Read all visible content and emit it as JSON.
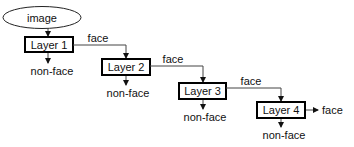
{
  "diagram": {
    "input": {
      "label": "image",
      "shape": "ellipse"
    },
    "layers": [
      {
        "label": "Layer 1",
        "reject_label": "non-face",
        "pass_label": "face"
      },
      {
        "label": "Layer 2",
        "reject_label": "non-face",
        "pass_label": "face"
      },
      {
        "label": "Layer 3",
        "reject_label": "non-face",
        "pass_label": "face"
      },
      {
        "label": "Layer 4",
        "reject_label": "non-face",
        "pass_label": "face"
      }
    ],
    "colors": {
      "box_border": "#000000",
      "line": "#444444",
      "text": "#111111",
      "background": "#ffffff"
    }
  }
}
